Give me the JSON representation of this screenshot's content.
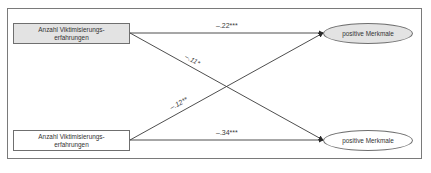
{
  "diagram": {
    "nodes": {
      "predictor_top": {
        "line1": "Anzahl Viktimisierungs-",
        "line2": "erfahrungen",
        "fill": "#e3e3e3"
      },
      "predictor_bottom": {
        "line1": "Anzahl Viktimisierungs-",
        "line2": "erfahrungen",
        "fill": "#ffffff"
      },
      "outcome_top": {
        "label": "positive Merkmale",
        "fill": "#e3e3e3"
      },
      "outcome_bottom": {
        "label": "positive Merkmale",
        "fill": "#ffffff"
      }
    },
    "paths": [
      {
        "from": "predictor_top",
        "to": "outcome_top",
        "coefficient": "–.22***"
      },
      {
        "from": "predictor_top",
        "to": "outcome_bottom",
        "coefficient": "–.11*"
      },
      {
        "from": "predictor_bottom",
        "to": "outcome_top",
        "coefficient": "–.12**"
      },
      {
        "from": "predictor_bottom",
        "to": "outcome_bottom",
        "coefficient": "–.34***"
      }
    ],
    "colors": {
      "line": "#3a3a3a",
      "frame": "#7a7a7a",
      "shaded_fill": "#e3e3e3"
    }
  }
}
